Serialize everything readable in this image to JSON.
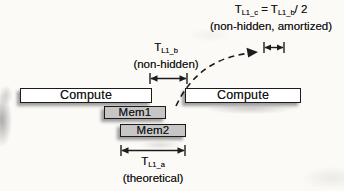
{
  "bars": {
    "compute_left": {
      "label": "Compute"
    },
    "compute_right": {
      "label": "Compute"
    },
    "mem1": {
      "label": "Mem1"
    },
    "mem2": {
      "label": "Mem2"
    }
  },
  "annotations": {
    "top": {
      "lhs_base": "T",
      "lhs_sub": "L1_c",
      "equals": " = ",
      "rhs_base": "T",
      "rhs_sub": "L1_b",
      "divisor": "/ 2",
      "note": "(non-hidden, amortized)"
    },
    "mid": {
      "base": "T",
      "sub": "L1_b",
      "note": "(non-hidden)"
    },
    "bottom": {
      "base": "T",
      "sub": "L1_a",
      "note": "(theoretical)"
    }
  },
  "icons": {
    "measure_arrow": "double-headed arrow with end ticks",
    "amortized_arrow": "dashed curved arrow"
  },
  "colors": {
    "background": "#fbfaf7",
    "bar_fill_white": "#ffffff",
    "bar_fill_gray": "#c6c6c6",
    "stroke": "#1c1c1c",
    "shadow": "rgba(20,20,20,0.40)"
  }
}
